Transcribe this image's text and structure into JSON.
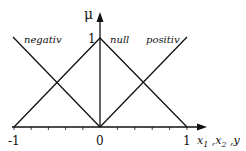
{
  "diagram": {
    "y_axis_label": "μ",
    "x_axis_label": "x₁ ,x₂ ,y",
    "x_axis_label_parts": [
      "x",
      "1",
      " ,x",
      "2",
      " ,y"
    ],
    "peak_label": "1",
    "x_ticks": [
      {
        "value": -1,
        "label": "-1"
      },
      {
        "value": 0,
        "label": "0"
      },
      {
        "value": 1,
        "label": "1"
      }
    ],
    "minor_ticks": [
      -0.8,
      -0.6,
      -0.4,
      -0.2,
      0.2,
      0.4,
      0.6,
      0.8
    ],
    "sets": [
      {
        "name": "negativ",
        "label": "negativ",
        "points": [
          [
            -1,
            1
          ],
          [
            0,
            0
          ]
        ]
      },
      {
        "name": "null",
        "label": "null",
        "points": [
          [
            -1,
            0
          ],
          [
            0,
            1
          ],
          [
            1,
            0
          ]
        ]
      },
      {
        "name": "positiv",
        "label": "positiv",
        "points": [
          [
            0,
            0
          ],
          [
            1,
            1
          ]
        ]
      }
    ],
    "line_color": "#111111"
  }
}
